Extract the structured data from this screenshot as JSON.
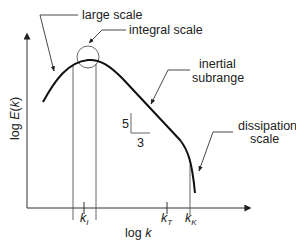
{
  "diagram": {
    "axes": {
      "y_label_prefix": "log ",
      "y_label_var": "E",
      "y_label_open": "(",
      "y_label_arg": "k",
      "y_label_close": ")",
      "x_label_prefix": "log ",
      "x_label_var": "k"
    },
    "ticks": [
      {
        "id": "k_I",
        "base": "k",
        "sub": "I"
      },
      {
        "id": "k_T",
        "base": "k",
        "sub": "T"
      },
      {
        "id": "k_K",
        "base": "k",
        "sub": "K"
      }
    ],
    "annotations": {
      "large_scale": "large scale",
      "integral_scale": "integral scale",
      "inertial_line1": "inertial",
      "inertial_line2": "subrange",
      "dissipation_line1": "dissipation",
      "dissipation_line2": "scale"
    },
    "slope_triangle": {
      "rise": "5",
      "run": "3"
    },
    "colors": {
      "curve": "#111111",
      "axes": "#333333",
      "lines": "#555555",
      "text": "#222222"
    }
  }
}
